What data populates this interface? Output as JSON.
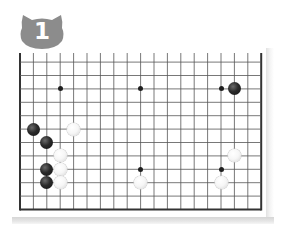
{
  "badge": {
    "number": "1",
    "shape": "cat-head",
    "color": "#8c8c8c",
    "text_color": "#ffffff"
  },
  "board": {
    "size": 19,
    "visible_rows": [
      7,
      18
    ],
    "visible_cols": [
      0,
      18
    ],
    "line_color": "#555555",
    "border_color": "#333333",
    "star_points": [
      {
        "col": 3,
        "row": 9
      },
      {
        "col": 9,
        "row": 9
      },
      {
        "col": 15,
        "row": 9
      },
      {
        "col": 9,
        "row": 15
      },
      {
        "col": 15,
        "row": 15
      }
    ],
    "stones": [
      {
        "color": "black",
        "col": 16,
        "row": 9
      },
      {
        "color": "black",
        "col": 1,
        "row": 12
      },
      {
        "color": "white",
        "col": 4,
        "row": 12
      },
      {
        "color": "black",
        "col": 2,
        "row": 13
      },
      {
        "color": "white",
        "col": 3,
        "row": 14
      },
      {
        "color": "black",
        "col": 2,
        "row": 15
      },
      {
        "color": "white",
        "col": 3,
        "row": 15
      },
      {
        "color": "black",
        "col": 2,
        "row": 16
      },
      {
        "color": "white",
        "col": 3,
        "row": 16
      },
      {
        "color": "white",
        "col": 16,
        "row": 14
      },
      {
        "color": "white",
        "col": 9,
        "row": 16
      },
      {
        "color": "white",
        "col": 15,
        "row": 16
      }
    ]
  }
}
